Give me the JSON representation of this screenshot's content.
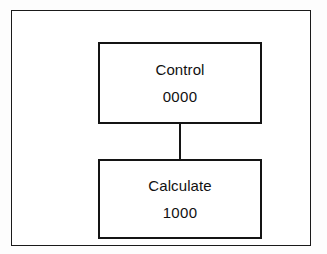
{
  "diagram": {
    "title": "",
    "colors": {
      "background": "#fdfdfd",
      "frame_fill": "#ffffff",
      "stroke": "#141414",
      "text": "#111111"
    },
    "frame": {
      "label": "outer-enclosure"
    },
    "nodes": [
      {
        "id": "control",
        "title": "Control",
        "value": "0000"
      },
      {
        "id": "calculate",
        "title": "Calculate",
        "value": "1000"
      }
    ],
    "connectors": [
      {
        "id": "control-to-calculate",
        "from": "control",
        "to": "calculate",
        "style": "solid-line",
        "orientation": "vertical"
      }
    ]
  }
}
